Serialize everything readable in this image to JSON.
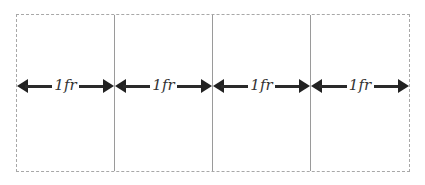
{
  "diagram": {
    "columns": [
      {
        "label": "1fr"
      },
      {
        "label": "1fr"
      },
      {
        "label": "1fr"
      },
      {
        "label": "1fr"
      }
    ],
    "colors": {
      "container_border": "#a8a8a8",
      "column_divider": "#9a9a9a",
      "arrow": "#222222",
      "label": "#333333"
    }
  }
}
